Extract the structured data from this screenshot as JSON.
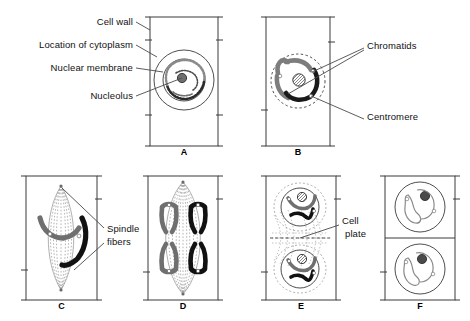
{
  "figure": {
    "background": "#ffffff",
    "stroke_color": "#3a3a3a",
    "chromosome_gray": "#7d7d7d",
    "chromosome_black": "#1a1a1a",
    "leader_color": "#4a4a4a"
  },
  "labels": [
    {
      "id": "cell-wall",
      "text": "Cell wall",
      "x": 133,
      "y": 22,
      "align": "right"
    },
    {
      "id": "cytoplasm",
      "text": "Location of cytoplasm",
      "x": 133,
      "y": 45,
      "align": "right"
    },
    {
      "id": "nuclear-membrane",
      "text": "Nuclear membrane",
      "x": 133,
      "y": 68,
      "align": "right"
    },
    {
      "id": "nucleolus",
      "text": "Nucleolus",
      "x": 133,
      "y": 96,
      "align": "right"
    },
    {
      "id": "chromatids",
      "text": "Chromatids",
      "x": 367,
      "y": 46,
      "align": "left"
    },
    {
      "id": "centromere",
      "text": "Centromere",
      "x": 367,
      "y": 117,
      "align": "left"
    },
    {
      "id": "spindle-fibers-1",
      "text": "Spindle",
      "x": 106,
      "y": 229,
      "align": "left"
    },
    {
      "id": "spindle-fibers-2",
      "text": "fibers",
      "x": 106,
      "y": 242,
      "align": "left"
    },
    {
      "id": "cell-plate-1",
      "text": "Cell",
      "x": 341,
      "y": 221,
      "align": "left"
    },
    {
      "id": "cell-plate-2",
      "text": "plate",
      "x": 341,
      "y": 234,
      "align": "left"
    }
  ],
  "panels": [
    {
      "id": "A",
      "letter": "A",
      "stage": "interphase",
      "x": 150,
      "y": 17,
      "w": 68,
      "h": 129,
      "letter_y": 147
    },
    {
      "id": "B",
      "letter": "B",
      "stage": "prophase",
      "x": 266,
      "y": 17,
      "w": 64,
      "h": 129,
      "letter_y": 147
    },
    {
      "id": "C",
      "letter": "C",
      "stage": "metaphase",
      "x": 26,
      "y": 176,
      "w": 71,
      "h": 124,
      "letter_y": 301
    },
    {
      "id": "D",
      "letter": "D",
      "stage": "anaphase",
      "x": 148,
      "y": 176,
      "w": 70,
      "h": 124,
      "letter_y": 301
    },
    {
      "id": "E",
      "letter": "E",
      "stage": "telophase",
      "x": 266,
      "y": 176,
      "w": 70,
      "h": 124,
      "letter_y": 301
    },
    {
      "id": "F",
      "letter": "F",
      "stage": "daughter-cells",
      "x": 385,
      "y": 176,
      "w": 70,
      "h": 124,
      "letter_y": 301
    }
  ]
}
